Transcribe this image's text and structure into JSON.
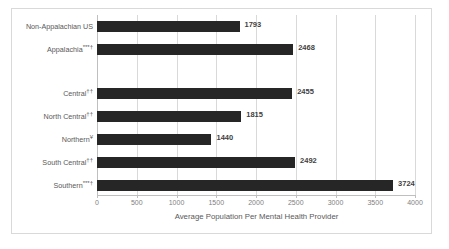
{
  "chart_data": {
    "type": "bar",
    "orientation": "horizontal",
    "title": "",
    "xlabel": "Average Population Per Mental Health Provider",
    "ylabel": "",
    "xlim": [
      0,
      4000
    ],
    "xticks": [
      0,
      500,
      1000,
      1500,
      2000,
      2500,
      3000,
      3500,
      4000
    ],
    "xtick_labels": [
      "0",
      "500",
      "1000",
      "1500",
      "2000",
      "2500",
      "3000",
      "3500",
      "4000"
    ],
    "grid": true,
    "legend": "none",
    "bar_color": "#262626",
    "gridline_color": "#d9d9d9",
    "categories": [
      "Non-Appalachian US",
      "Appalachia***†",
      "Central††",
      "North Central††",
      "Northern¥",
      "South Central††",
      "Southern***†"
    ],
    "values": [
      1793,
      2468,
      2455,
      1815,
      1440,
      2492,
      3724
    ],
    "data_labels": [
      "1793",
      "2468",
      "2455",
      "1815",
      "1440",
      "2492",
      "3724"
    ],
    "bars": [
      {
        "label": "Non-Appalachian US",
        "label_text": "Non-Appalachian US",
        "sup": "",
        "value": 1793,
        "value_text": "1793",
        "top": 6
      },
      {
        "label": "Appalachia",
        "label_text": "Appalachia",
        "sup": "***†",
        "value": 2468,
        "value_text": "2468",
        "top": 29
      },
      {
        "label": "Central",
        "label_text": "Central",
        "sup": "††",
        "value": 2455,
        "value_text": "2455",
        "top": 73
      },
      {
        "label": "North Central",
        "label_text": "North Central",
        "sup": "††",
        "value": 1815,
        "value_text": "1815",
        "top": 96
      },
      {
        "label": "Northern",
        "label_text": "Northern",
        "sup": "¥",
        "value": 1440,
        "value_text": "1440",
        "top": 119
      },
      {
        "label": "South Central",
        "label_text": "South Central",
        "sup": "††",
        "value": 2492,
        "value_text": "2492",
        "top": 142
      },
      {
        "label": "Southern",
        "label_text": "Southern",
        "sup": "***†",
        "value": 3724,
        "value_text": "3724",
        "top": 165
      }
    ]
  }
}
